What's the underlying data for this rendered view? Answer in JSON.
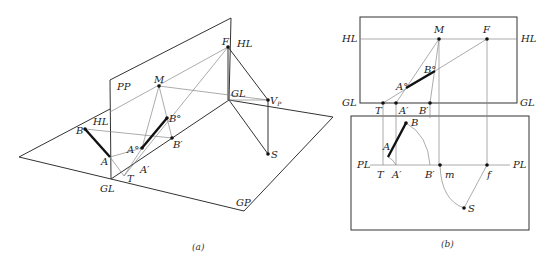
{
  "top_cut_text": "……（已被截断的正文行）……",
  "figure_a": {
    "caption": "(a)",
    "labels": {
      "PP": "PP",
      "HL_left": "HL",
      "HL_right": "HL",
      "GL_bottom": "GL",
      "GL_right": "GL",
      "GP": "GP",
      "F": "F",
      "M": "M",
      "B": "B",
      "A": "A",
      "A_deg": "A°",
      "B_deg": "B°",
      "B_prime": "B′",
      "A_prime": "A′",
      "T": "T",
      "Vp": "V",
      "Vp_sub": "P",
      "S": "S"
    }
  },
  "figure_b": {
    "caption": "(b)",
    "labels": {
      "HL_left": "HL",
      "HL_right": "HL",
      "GL_left": "GL",
      "GL_right": "GL",
      "PL_left": "PL",
      "PL_right": "PL",
      "M": "M",
      "F": "F",
      "A_deg": "A°",
      "B_deg": "B°",
      "T_top": "T",
      "A_prime_top": "A′",
      "B_prime_top": "B′",
      "B": "B",
      "A": "A",
      "T_bot": "T",
      "A_prime_bot": "A′",
      "B_prime_bot": "B′",
      "m": "m",
      "f": "f",
      "S": "S"
    }
  }
}
